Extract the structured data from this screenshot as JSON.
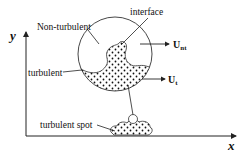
{
  "diagram": {
    "axes": {
      "x_label": "x",
      "y_label": "y"
    },
    "labels": {
      "non_turbulent": "Non-turbulent",
      "interface": "interface",
      "turbulent": "turbulent",
      "turbulent_spot": "turbulent spot"
    },
    "velocities": [
      {
        "symbol": "U",
        "subscript": "nt"
      },
      {
        "symbol": "U",
        "subscript": "t"
      }
    ],
    "colors": {
      "line": "#222222",
      "dots": "#111111",
      "background": "#ffffff"
    }
  }
}
